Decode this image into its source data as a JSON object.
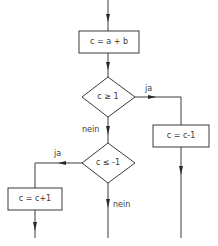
{
  "diagram": {
    "type": "flowchart",
    "nodes": [
      {
        "id": "assign",
        "shape": "rectangle",
        "text": "c = a + b"
      },
      {
        "id": "cond1",
        "shape": "diamond",
        "text": "c ≥ 1"
      },
      {
        "id": "cond2",
        "shape": "diamond",
        "text": "c ≤ -1"
      },
      {
        "id": "dec",
        "shape": "rectangle",
        "text": "c = c-1"
      },
      {
        "id": "inc",
        "shape": "rectangle",
        "text": "c = c+1"
      }
    ],
    "edges": [
      {
        "from": "start",
        "to": "assign",
        "label": ""
      },
      {
        "from": "assign",
        "to": "cond1",
        "label": ""
      },
      {
        "from": "cond1",
        "to": "dec",
        "label": "ja"
      },
      {
        "from": "cond1",
        "to": "cond2",
        "label": "nein"
      },
      {
        "from": "cond2",
        "to": "inc",
        "label": "ja"
      },
      {
        "from": "cond2",
        "to": "exit",
        "label": "nein"
      }
    ],
    "labels": {
      "cond1_yes": "ja",
      "cond1_no": "nein",
      "cond2_yes": "ja",
      "cond2_no": "nein"
    },
    "colors": {
      "line": "#3a3a3a",
      "background": "#ffffff"
    }
  }
}
